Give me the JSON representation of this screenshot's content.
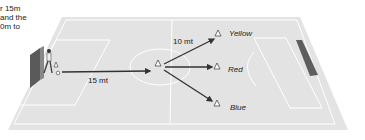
{
  "caption": {
    "lines": [
      "r 15m",
      "and the",
      "0m to"
    ]
  },
  "diagram": {
    "distance_start": "15 mt",
    "distance_branch": "10 mt",
    "cones": [
      {
        "label": "Yellow"
      },
      {
        "label": "Red"
      },
      {
        "label": "Blue"
      }
    ],
    "colors": {
      "pitch": "#e4e4e4",
      "lines": "#ffffff",
      "arrows": "#333333",
      "goal": "#555555"
    }
  }
}
